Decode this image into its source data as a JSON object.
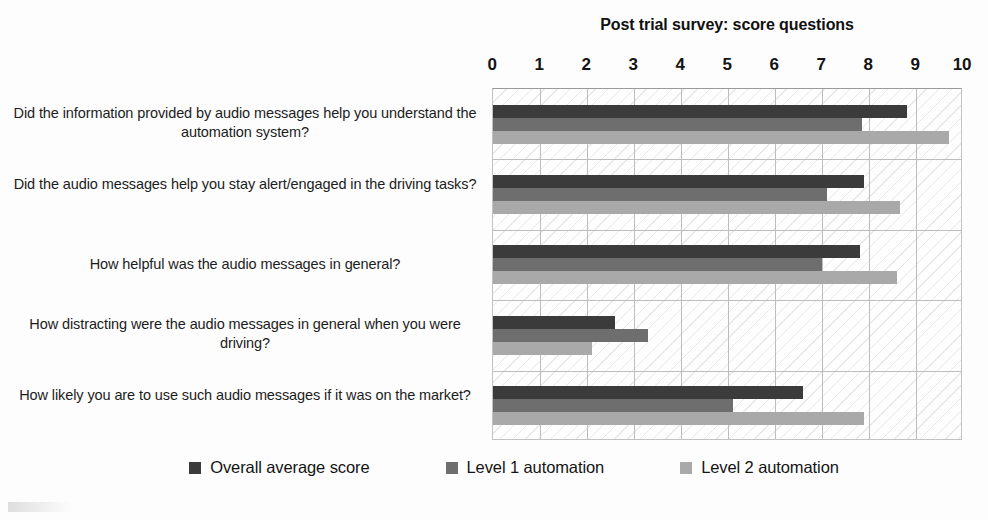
{
  "chart_data": {
    "type": "bar",
    "orientation": "horizontal",
    "title": "Post trial survey: score questions",
    "xlabel": "",
    "ylabel": "",
    "xlim": [
      0,
      10
    ],
    "xticks": [
      0,
      1,
      2,
      3,
      4,
      5,
      6,
      7,
      8,
      9,
      10
    ],
    "grid": true,
    "grid_axis": "both",
    "legend_position": "bottom",
    "categories": [
      "Did the information provided by audio messages help you understand the automation system?",
      "Did the audio messages help you stay alert/engaged in the driving tasks?",
      "How helpful was the audio messages in general?",
      "How distracting were the audio messages in general when you were driving?",
      "How likely you are to use such audio messages if it was on the market?"
    ],
    "series": [
      {
        "name": "Overall average score",
        "color": "#3b3b3b",
        "values": [
          8.8,
          7.9,
          7.8,
          2.6,
          6.6
        ]
      },
      {
        "name": "Level 1 automation",
        "color": "#6e6e6e",
        "values": [
          7.85,
          7.1,
          7.0,
          3.3,
          5.1
        ]
      },
      {
        "name": "Level 2 automation",
        "color": "#a9a9a9",
        "values": [
          9.7,
          8.65,
          8.6,
          2.1,
          7.9
        ]
      }
    ]
  },
  "axis": {
    "tick_labels": [
      "0",
      "1",
      "2",
      "3",
      "4",
      "5",
      "6",
      "7",
      "8",
      "9",
      "10"
    ]
  },
  "legend": {
    "items": [
      {
        "label": "Overall average score",
        "color": "#3b3b3b"
      },
      {
        "label": "Level 1 automation",
        "color": "#6e6e6e"
      },
      {
        "label": "Level 2 automation",
        "color": "#a9a9a9"
      }
    ]
  }
}
